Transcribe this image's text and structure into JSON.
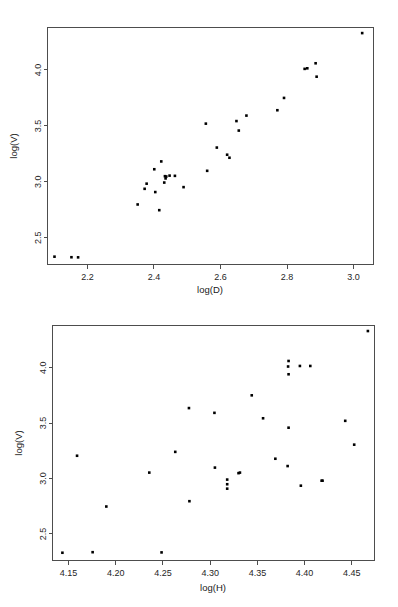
{
  "figure": {
    "background": "#ffffff",
    "point_color": "#000000",
    "axis_color": "#4d4d4d",
    "panel_count": 2
  },
  "chart_data": [
    {
      "id": "scatter-logD-logV",
      "type": "scatter",
      "title": "",
      "xlabel": "log(D)",
      "ylabel": "log(V)",
      "xlim": [
        2.08,
        3.06
      ],
      "ylim": [
        2.26,
        4.38
      ],
      "xticks": [
        2.2,
        2.4,
        2.6,
        2.8,
        3.0
      ],
      "xticklabels": [
        "2.2",
        "2.4",
        "2.6",
        "2.8",
        "3.0"
      ],
      "yticks": [
        2.5,
        3.0,
        3.5,
        4.0
      ],
      "yticklabels": [
        "2.5",
        "3.0",
        "3.5",
        "4.0"
      ],
      "grid": false,
      "legend": "none",
      "marker": "filled-square",
      "n_points": 32,
      "x": [
        2.101,
        2.152,
        2.172,
        2.351,
        2.372,
        2.378,
        2.401,
        2.404,
        2.416,
        2.422,
        2.431,
        2.433,
        2.435,
        2.437,
        2.447,
        2.463,
        2.489,
        2.556,
        2.56,
        2.589,
        2.62,
        2.627,
        2.648,
        2.655,
        2.678,
        2.771,
        2.791,
        2.853,
        2.861,
        2.886,
        2.889,
        3.026
      ],
      "y": [
        2.33,
        2.325,
        2.324,
        2.797,
        2.937,
        2.983,
        3.112,
        2.908,
        2.746,
        3.182,
        2.993,
        3.05,
        3.03,
        3.047,
        3.055,
        3.053,
        2.952,
        3.52,
        3.098,
        3.306,
        3.242,
        3.215,
        3.543,
        3.458,
        3.592,
        3.64,
        3.75,
        4.01,
        4.015,
        4.06,
        3.94,
        4.33
      ]
    },
    {
      "id": "scatter-logH-logV",
      "type": "scatter",
      "title": "",
      "xlabel": "log(H)",
      "ylabel": "log(V)",
      "xlim": [
        4.133,
        4.474
      ],
      "ylim": [
        2.26,
        4.38
      ],
      "xticks": [
        4.15,
        4.2,
        4.25,
        4.3,
        4.35,
        4.4,
        4.45
      ],
      "xticklabels": [
        "4.15",
        "4.20",
        "4.25",
        "4.30",
        "4.35",
        "4.40",
        "4.45"
      ],
      "yticks": [
        2.5,
        3.0,
        3.5,
        4.0
      ],
      "yticklabels": [
        "2.5",
        "3.0",
        "3.5",
        "4.0"
      ],
      "grid": false,
      "legend": "none",
      "marker": "filled-square",
      "n_points": 32,
      "x": [
        4.1435,
        4.159,
        4.1755,
        4.19,
        4.2485,
        4.2355,
        4.263,
        4.2775,
        4.278,
        4.3045,
        4.305,
        4.318,
        4.318,
        4.318,
        4.33,
        4.3315,
        4.344,
        4.356,
        4.369,
        4.382,
        4.383,
        4.383,
        4.383,
        4.395,
        4.396,
        4.406,
        4.418,
        4.419,
        4.443,
        4.4525,
        4.467,
        4.3825
      ],
      "y": [
        2.33,
        3.205,
        2.335,
        2.747,
        2.333,
        3.053,
        3.24,
        3.635,
        2.795,
        3.592,
        3.098,
        2.99,
        2.948,
        2.908,
        3.048,
        3.053,
        3.75,
        3.543,
        3.178,
        3.112,
        3.458,
        3.94,
        4.06,
        4.015,
        2.935,
        4.015,
        2.98,
        2.98,
        3.52,
        3.305,
        4.33,
        4.01
      ]
    }
  ]
}
